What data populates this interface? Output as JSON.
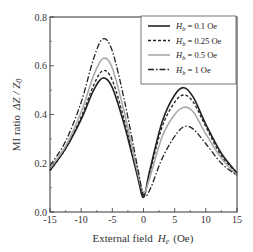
{
  "chart_data": {
    "type": "line",
    "title": "",
    "xlabel": "External field  H_e (Oe)",
    "ylabel": "MI ratio  ΔZ / Z_0",
    "xlim": [
      -15,
      15
    ],
    "ylim": [
      0.0,
      0.8
    ],
    "xticks": [
      -15,
      -10,
      -5,
      0,
      5,
      10,
      15
    ],
    "xtick_labels": [
      "-15",
      "-10",
      "-5",
      "0",
      "5",
      "10",
      "15"
    ],
    "yticks": [
      0.0,
      0.2,
      0.4,
      0.6,
      0.8
    ],
    "ytick_labels": [
      "0.0",
      "0.2",
      "0.4",
      "0.6",
      "0.8"
    ],
    "grid": false,
    "legend_position": "upper right",
    "x": [
      -15,
      -12.5,
      -10,
      -8,
      -6.5,
      -5,
      -3,
      -1,
      0,
      1,
      3,
      5,
      6.5,
      8,
      10,
      12.5,
      15
    ],
    "series": [
      {
        "name": "H_b = 0.1 Oe",
        "style": "solid",
        "color": "#222222",
        "values": [
          0.17,
          0.26,
          0.38,
          0.5,
          0.55,
          0.51,
          0.35,
          0.15,
          0.06,
          0.17,
          0.37,
          0.48,
          0.51,
          0.47,
          0.36,
          0.24,
          0.16
        ]
      },
      {
        "name": "H_b = 0.25 Oe",
        "style": "dashed",
        "color": "#222222",
        "values": [
          0.17,
          0.26,
          0.39,
          0.52,
          0.58,
          0.54,
          0.37,
          0.16,
          0.07,
          0.16,
          0.35,
          0.45,
          0.48,
          0.45,
          0.35,
          0.23,
          0.16
        ]
      },
      {
        "name": "H_b = 0.5 Oe",
        "style": "solid-gray",
        "color": "#aaaaaa",
        "values": [
          0.18,
          0.27,
          0.41,
          0.56,
          0.63,
          0.59,
          0.4,
          0.17,
          0.08,
          0.14,
          0.31,
          0.4,
          0.43,
          0.41,
          0.32,
          0.22,
          0.15
        ]
      },
      {
        "name": "H_b = 1 Oe",
        "style": "dash-dot",
        "color": "#222222",
        "values": [
          0.19,
          0.29,
          0.45,
          0.63,
          0.71,
          0.66,
          0.45,
          0.19,
          0.07,
          0.09,
          0.22,
          0.31,
          0.35,
          0.34,
          0.28,
          0.2,
          0.15
        ]
      }
    ]
  },
  "axes": {
    "x_label_main": "External field",
    "x_label_var": "H",
    "x_label_sub": "e",
    "x_label_unit": "(Oe)",
    "y_label_main": "MI ratio",
    "y_label_expr": "ΔZ / Z",
    "y_label_sub": "0"
  },
  "legend": {
    "items": [
      {
        "var": "H",
        "sub": "b",
        "rest": " = 0.1 Oe"
      },
      {
        "var": "H",
        "sub": "b",
        "rest": " = 0.25 Oe"
      },
      {
        "var": "H",
        "sub": "b",
        "rest": " = 0.5 Oe"
      },
      {
        "var": "H",
        "sub": "b",
        "rest": " = 1 Oe"
      }
    ]
  }
}
